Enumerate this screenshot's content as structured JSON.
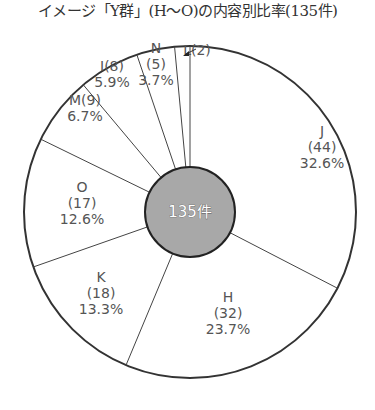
{
  "title": "イメージ「Y群」(H〜O)の内容別比率(135件)",
  "center_label": "135件",
  "chart_data": {
    "type": "pie",
    "variant": "donut",
    "title": "イメージ「Y群」(H〜O)の内容別比率(135件)",
    "total": 135,
    "center_label": "135件",
    "start_angle": "12 o'clock",
    "direction": "clockwise",
    "categories": [
      "J",
      "H",
      "K",
      "O",
      "M",
      "I",
      "N",
      "L"
    ],
    "values": [
      44,
      32,
      18,
      17,
      9,
      8,
      5,
      2
    ],
    "percentages": [
      32.6,
      23.7,
      13.3,
      12.6,
      6.7,
      5.9,
      3.7,
      1.5
    ],
    "labels": [
      {
        "name": "J",
        "count": "(44)",
        "pct": "32.6%"
      },
      {
        "name": "H",
        "count": "(32)",
        "pct": "23.7%"
      },
      {
        "name": "K",
        "count": "(18)",
        "pct": "13.3%"
      },
      {
        "name": "O",
        "count": "(17)",
        "pct": "12.6%"
      },
      {
        "name": "M",
        "count": "(9)",
        "pct": "6.7%"
      },
      {
        "name": "I",
        "count": "(8)",
        "pct": "5.9%"
      },
      {
        "name": "N",
        "count": "(5)",
        "pct": "3.7%"
      },
      {
        "name": "L",
        "count": "(2)",
        "pct": ""
      }
    ],
    "colors": {
      "slice_fill": "#ffffff",
      "slice_stroke": "#333333",
      "center_fill": "#a8a8a8",
      "label_text": "#555555"
    },
    "legend": "none"
  }
}
